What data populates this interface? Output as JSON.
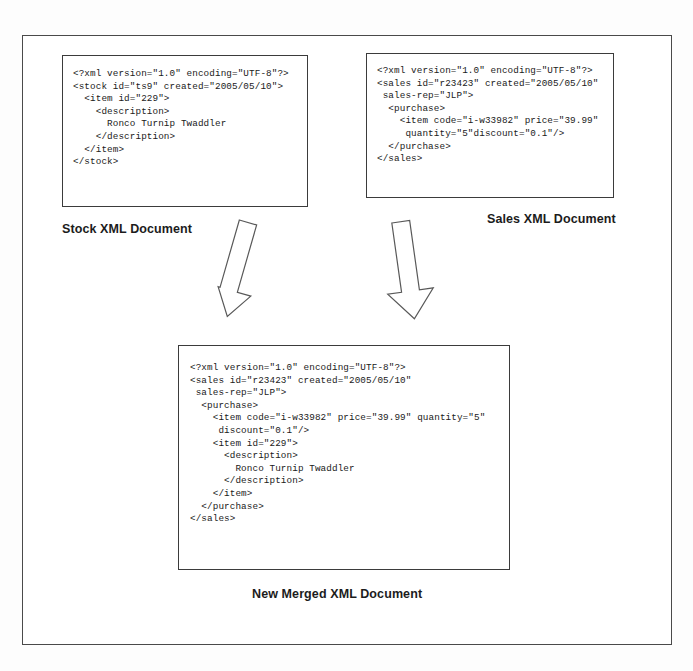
{
  "diagram": {
    "frame_color": "#4a4a4a",
    "box_border_color": "#3b3b3b",
    "arrow_stroke_color": "#595959",
    "arrow_fill_color": "#ffffff",
    "text_color": "#1a1a1a"
  },
  "documents": {
    "stock": {
      "caption": "Stock XML Document",
      "code": "<?xml version=\"1.0\" encoding=\"UTF-8\"?>\n<stock id=\"ts9\" created=\"2005/05/10\">\n  <item id=\"229\">\n    <description>\n      Ronco Turnip Twaddler\n    </description>\n  </item>\n</stock>"
    },
    "sales": {
      "caption": "Sales XML Document",
      "code": "<?xml version=\"1.0\" encoding=\"UTF-8\"?>\n<sales id=\"r23423\" created=\"2005/05/10\"\n sales-rep=\"JLP\">\n  <purchase>\n    <item code=\"i-w33982\" price=\"39.99\"\n     quantity=\"5\"discount=\"0.1\"/>\n  </purchase>\n</sales>"
    },
    "merged": {
      "caption": "New Merged XML Document",
      "code": "<?xml version=\"1.0\" encoding=\"UTF-8\"?>\n<sales id=\"r23423\" created=\"2005/05/10\"\n sales-rep=\"JLP\">\n  <purchase>\n    <item code=\"i-w33982\" price=\"39.99\" quantity=\"5\"\n     discount=\"0.1\"/>\n    <item id=\"229\">\n      <description>\n        Ronco Turnip Twaddler\n      </description>\n    </item>\n  </purchase>\n</sales>"
    }
  },
  "arrows": [
    {
      "name": "stock-to-merged",
      "label": "merge-arrow-left",
      "direction": "down-right"
    },
    {
      "name": "sales-to-merged",
      "label": "merge-arrow-right",
      "direction": "down-left"
    }
  ]
}
